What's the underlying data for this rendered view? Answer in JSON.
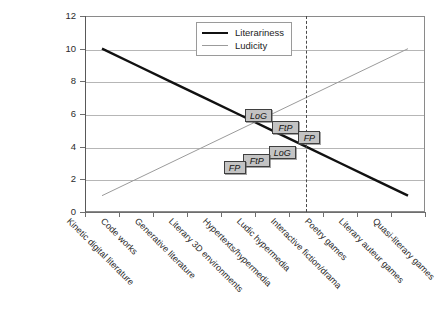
{
  "chart_data": {
    "type": "line",
    "title": "",
    "subtitle": "",
    "xlabel": "",
    "ylabel": "",
    "ylim": [
      0,
      12
    ],
    "yticks": [
      0,
      2,
      4,
      6,
      8,
      10,
      12
    ],
    "grid": true,
    "legend_position": "top-center",
    "categories": [
      "Kinetic digital literature",
      "Code works",
      "Generative literature",
      "Literary 3D environments",
      "Hypertexts/hypermedia",
      "Ludic hypermedia",
      "Interactive fiction/drama",
      "Poetry games",
      "Literary auteur games",
      "Quasi-literary games"
    ],
    "series": [
      {
        "name": "Literariness",
        "color": "#111111",
        "style": "thick-solid",
        "values": [
          10,
          9,
          8,
          7,
          6,
          5,
          4,
          3,
          2,
          1
        ]
      },
      {
        "name": "Ludicity",
        "color": "#9b9b9b",
        "style": "thin-solid",
        "values": [
          1,
          2,
          3,
          4,
          5,
          6,
          7,
          8,
          9,
          10
        ]
      }
    ],
    "annotations": {
      "crossing_line": {
        "type": "vertical-dashed",
        "at_category": "Interactive fiction/drama",
        "at_index": 6,
        "color": "#4a4a4a"
      },
      "markers": [
        {
          "label": "LoG",
          "row": "upper",
          "x_index": 4.6,
          "y": 5.9
        },
        {
          "label": "FtP",
          "row": "upper",
          "x_index": 5.4,
          "y": 5.15
        },
        {
          "label": "FP",
          "row": "upper",
          "x_index": 6.1,
          "y": 4.55
        },
        {
          "label": "LoG",
          "row": "lower",
          "x_index": 5.3,
          "y": 3.65
        },
        {
          "label": "FtP",
          "row": "lower",
          "x_index": 4.55,
          "y": 3.15
        },
        {
          "label": "FP",
          "row": "lower",
          "x_index": 3.9,
          "y": 2.7
        }
      ]
    }
  },
  "legend": {
    "items": [
      {
        "label": "Literariness",
        "swatch": "thick"
      },
      {
        "label": "Ludicity",
        "swatch": "thin"
      }
    ]
  }
}
